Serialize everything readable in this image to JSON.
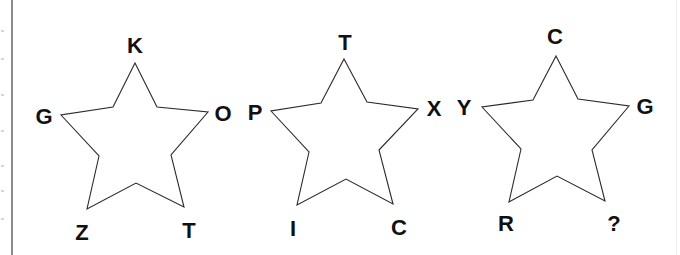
{
  "puzzle": {
    "type": "star letter sequence puzzle",
    "stroke_color": "#2a2a2a",
    "text_color": "#111111",
    "stars": [
      {
        "id": "star-1",
        "points": "135,63 157,107 208,112 171,155 184,207 136,183 87,209 99,156 61,115 113,107",
        "labels": {
          "top": {
            "text": "K",
            "x": 135,
            "y": 45
          },
          "left": {
            "text": "G",
            "x": 44,
            "y": 116
          },
          "right": {
            "text": "O",
            "x": 223,
            "y": 113
          },
          "bottom_left": {
            "text": "Z",
            "x": 82,
            "y": 232
          },
          "bottom_right": {
            "text": "T",
            "x": 189,
            "y": 230
          }
        }
      },
      {
        "id": "star-2",
        "points": "344,59 367,102 418,109 379,150 393,204 346,179 297,205 309,152 271,111 321,103",
        "labels": {
          "top": {
            "text": "T",
            "x": 345,
            "y": 42
          },
          "left": {
            "text": "P",
            "x": 255,
            "y": 112
          },
          "right": {
            "text": "X",
            "x": 434,
            "y": 108
          },
          "bottom_left": {
            "text": "I",
            "x": 293,
            "y": 228
          },
          "bottom_right": {
            "text": "C",
            "x": 399,
            "y": 227
          }
        }
      },
      {
        "id": "star-3",
        "points": "556,56 578,99 629,106 592,150 605,201 557,176 509,202 521,149 482,107 533,100",
        "labels": {
          "top": {
            "text": "C",
            "x": 555,
            "y": 36
          },
          "left": {
            "text": "Y",
            "x": 464,
            "y": 107
          },
          "right": {
            "text": "G",
            "x": 645,
            "y": 106
          },
          "bottom_left": {
            "text": "R",
            "x": 506,
            "y": 223
          },
          "bottom_right": {
            "text": "?",
            "x": 614,
            "y": 223
          }
        }
      }
    ]
  }
}
